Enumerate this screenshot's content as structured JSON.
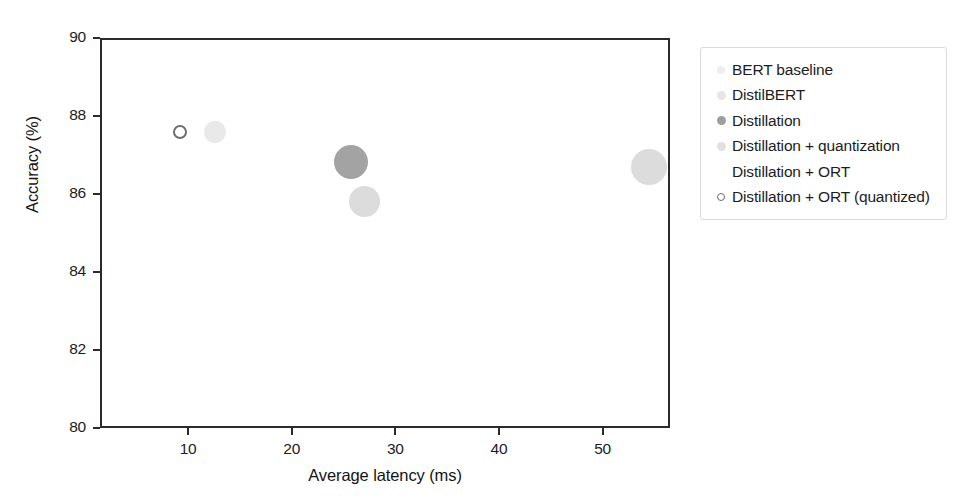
{
  "chart_data": {
    "type": "scatter",
    "title": "",
    "xlabel": "Average latency (ms)",
    "ylabel": "Accuracy (%)",
    "xlim": [
      1.5,
      56.5
    ],
    "ylim": [
      80,
      90
    ],
    "xticks": [
      10,
      20,
      30,
      40,
      50
    ],
    "xtick_labels": [
      "10",
      "20",
      "30",
      "40",
      "50"
    ],
    "yticks": [
      80,
      82,
      84,
      86,
      88,
      90
    ],
    "ytick_labels": [
      "80",
      "82",
      "84",
      "86",
      "88",
      "90"
    ],
    "grid": false,
    "legend_position": "right",
    "size_encodes": "model size",
    "series": [
      {
        "name": "BERT baseline",
        "x": [],
        "y": [],
        "color": "#efefef",
        "marker_px": 9,
        "legend_dot_px": 8,
        "filled": true
      },
      {
        "name": "DistilBERT",
        "x": [],
        "y": [],
        "color": "#e4e4e4",
        "marker_px": 9,
        "legend_dot_px": 9,
        "filled": true
      },
      {
        "name": "Distillation",
        "x": [
          25.5
        ],
        "y": [
          86.88
        ],
        "color": "#a3a3a3",
        "marker_px": 34,
        "legend_dot_px": 9,
        "filled": true
      },
      {
        "name": "Distillation + quantization",
        "x": [
          26.8
        ],
        "y": [
          85.85
        ],
        "color": "#dcdcdc",
        "marker_px": 31,
        "legend_dot_px": 9,
        "filled": true
      },
      {
        "name": "Distillation + ORT",
        "x": [
          12.4
        ],
        "y": [
          87.65
        ],
        "color": "#e9e9e9",
        "marker_px": 22,
        "legend_dot_px": 0,
        "filled": true
      },
      {
        "name": "Distillation + ORT (quantized)",
        "x": [
          9.0
        ],
        "y": [
          87.65
        ],
        "color": "#6e6e6e",
        "marker_px": 14,
        "legend_dot_px": 8,
        "filled": false
      }
    ],
    "extra_points": [
      {
        "series": "Distillation + quantization",
        "label": "large-right",
        "x": 54.3,
        "y": 86.75,
        "color": "#dcdcdc",
        "marker_px": 36,
        "filled": true
      }
    ],
    "points_all": [
      {
        "label": "Distillation + ORT (quantized)",
        "x": 9.0,
        "y": 87.65,
        "size_px": 14,
        "color": "#6e6e6e",
        "filled": false
      },
      {
        "label": "Distillation + ORT",
        "x": 12.4,
        "y": 87.65,
        "size_px": 22,
        "color": "#e9e9e9",
        "filled": true
      },
      {
        "label": "Distillation",
        "x": 25.5,
        "y": 86.88,
        "size_px": 34,
        "color": "#a3a3a3",
        "filled": true
      },
      {
        "label": "Distillation + quantization",
        "x": 26.8,
        "y": 85.85,
        "size_px": 31,
        "color": "#dcdcdc",
        "filled": true
      },
      {
        "label": "BERT baseline",
        "x": 54.3,
        "y": 86.75,
        "size_px": 36,
        "color": "#dcdcdc",
        "filled": true
      }
    ]
  },
  "legend": {
    "items": [
      {
        "label": "BERT baseline",
        "color": "#efefef",
        "dot_px": 8,
        "filled": true
      },
      {
        "label": "DistilBERT",
        "color": "#e6e6e6",
        "dot_px": 9,
        "filled": true
      },
      {
        "label": "Distillation",
        "color": "#9e9e9e",
        "dot_px": 9,
        "filled": true
      },
      {
        "label": "Distillation + quantization",
        "color": "#e0e0e0",
        "dot_px": 9,
        "filled": true
      },
      {
        "label": "Distillation + ORT",
        "color": "#ffffff",
        "dot_px": 0,
        "filled": true
      },
      {
        "label": "Distillation + ORT (quantized)",
        "color": "#6e6e6e",
        "dot_px": 8,
        "filled": false
      }
    ]
  },
  "style": {
    "axis_color": "#2b2b2b",
    "text_color": "#1c1c1c",
    "background": "#ffffff",
    "legend_border": "#d9d9d9"
  }
}
